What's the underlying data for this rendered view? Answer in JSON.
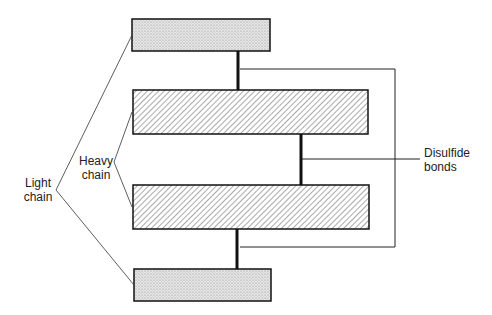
{
  "labels": {
    "heavy_chain": [
      "Heavy",
      "chain"
    ],
    "light_chain": [
      "Light",
      "chain"
    ],
    "disulfide_bonds": [
      "Disulfide",
      "bonds"
    ]
  },
  "colors": {
    "outline": "#111111",
    "light_chain_fill": "#dcdcdc",
    "heavy_chain_hatch": "#555555"
  }
}
